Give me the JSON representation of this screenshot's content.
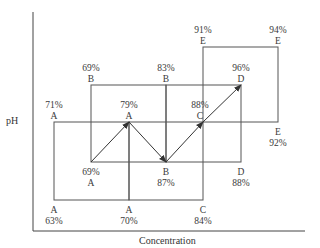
{
  "axes": {
    "y_label": "pH",
    "x_label": "Concentration"
  },
  "colors": {
    "line": "#555555",
    "axis": "#444444",
    "text": "#3a3a3a"
  },
  "rectangles": [
    {
      "id": "A",
      "x1": 54,
      "y1": 122,
      "x2": 129,
      "y2": 200
    },
    {
      "id": "B",
      "x1": 91,
      "y1": 85,
      "x2": 166,
      "y2": 162
    },
    {
      "id": "C",
      "x1": 129,
      "y1": 122,
      "x2": 203,
      "y2": 200
    },
    {
      "id": "D",
      "x1": 166,
      "y1": 85,
      "x2": 241,
      "y2": 162
    },
    {
      "id": "E",
      "x1": 203,
      "y1": 47,
      "x2": 278,
      "y2": 122
    }
  ],
  "labels": [
    {
      "pct": "71%",
      "letter": "A",
      "x": 54,
      "y": 100,
      "order": "pct-first"
    },
    {
      "pct": "79%",
      "letter": "A",
      "x": 129,
      "y": 100,
      "order": "pct-first"
    },
    {
      "pct": "63%",
      "letter": "A",
      "x": 54,
      "y": 205,
      "order": "letter-first"
    },
    {
      "pct": "70%",
      "letter": "A",
      "x": 129,
      "y": 205,
      "order": "letter-first"
    },
    {
      "pct": "69%",
      "letter": "B",
      "x": 91,
      "y": 63,
      "order": "pct-first"
    },
    {
      "pct": "83%",
      "letter": "B",
      "x": 166,
      "y": 63,
      "order": "pct-first"
    },
    {
      "pct": "69%",
      "letter": "A",
      "x": 91,
      "y": 167,
      "order": "pct-first"
    },
    {
      "pct": "87%",
      "letter": "B",
      "x": 166,
      "y": 167,
      "order": "letter-first"
    },
    {
      "pct": "88%",
      "letter": "C",
      "x": 200,
      "y": 100,
      "order": "pct-first"
    },
    {
      "pct": "84%",
      "letter": "C",
      "x": 203,
      "y": 205,
      "order": "letter-first"
    },
    {
      "pct": "96%",
      "letter": "D",
      "x": 241,
      "y": 63,
      "order": "pct-first"
    },
    {
      "pct": "88%",
      "letter": "D",
      "x": 241,
      "y": 167,
      "order": "letter-first"
    },
    {
      "pct": "91%",
      "letter": "E",
      "x": 203,
      "y": 25,
      "order": "pct-first"
    },
    {
      "pct": "94%",
      "letter": "E",
      "x": 278,
      "y": 25,
      "order": "pct-first"
    },
    {
      "pct": "92%",
      "letter": "E",
      "x": 278,
      "y": 127,
      "order": "letter-first"
    }
  ],
  "path": {
    "points": [
      [
        91,
        162
      ],
      [
        129,
        122
      ],
      [
        166,
        162
      ],
      [
        203,
        122
      ],
      [
        241,
        85
      ]
    ],
    "arrows": [
      {
        "from": [
          91,
          162
        ],
        "to": [
          129,
          122
        ]
      },
      {
        "from": [
          129,
          122
        ],
        "to": [
          166,
          162
        ]
      },
      {
        "from": [
          166,
          162
        ],
        "to": [
          203,
          122
        ]
      },
      {
        "from": [
          203,
          122
        ],
        "to": [
          241,
          85
        ]
      }
    ]
  }
}
